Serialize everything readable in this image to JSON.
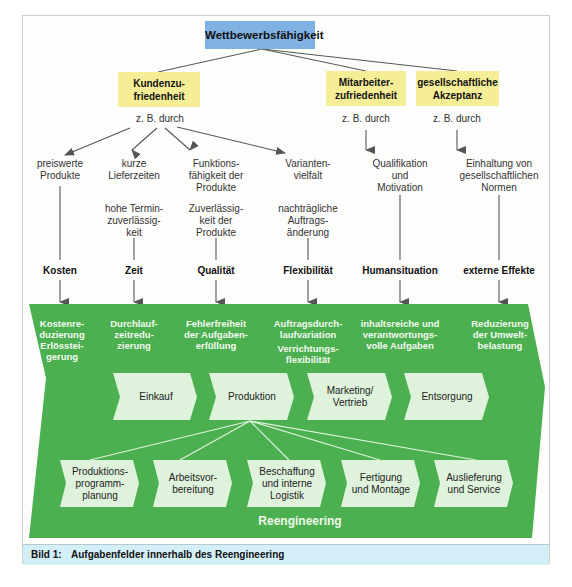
{
  "diagram": {
    "root": {
      "label": "Wettbewerbsfähigkeit",
      "color": "#7fb1e3"
    },
    "goals": [
      {
        "id": "kunden",
        "label_lines": [
          "Kundenzu-",
          "friedenheit"
        ],
        "via": "z. B. durch",
        "color": "#f5ee96"
      },
      {
        "id": "mitarbeiter",
        "label_lines": [
          "Mitarbeiter-",
          "zufriedenheit"
        ],
        "via": "z. B. durch",
        "color": "#f5ee96"
      },
      {
        "id": "gesellschaft",
        "label_lines": [
          "gesellschaftliche",
          "Akzeptanz"
        ],
        "via": "z. B. durch",
        "color": "#f5ee96"
      }
    ],
    "columns": [
      {
        "means": [
          "preiswerte",
          "Produkte"
        ],
        "detail": [],
        "criterion": "Kosten",
        "effect": [
          "Kostenre-",
          "duzierung",
          "Erlösstei-",
          "gerung"
        ]
      },
      {
        "means": [
          "kurze",
          "Lieferzeiten"
        ],
        "detail": [
          "hohe Termin-",
          "zuverlässig-",
          "keit"
        ],
        "criterion": "Zeit",
        "effect": [
          "Durchlauf-",
          "zeitredu-",
          "zierung"
        ]
      },
      {
        "means": [
          "Funktions-",
          "fähigkeit der",
          "Produkte"
        ],
        "detail": [
          "Zuverlässig-",
          "keit der",
          "Produkte"
        ],
        "criterion": "Qualität",
        "effect": [
          "Fehlerfreiheit",
          "der Aufgaben-",
          "erfüllung"
        ]
      },
      {
        "means": [
          "Varianten-",
          "vielfalt"
        ],
        "detail": [
          "nachträgliche",
          "Auftrags-",
          "änderung"
        ],
        "criterion": "Flexibilität",
        "effect": [
          "Auftragsdurch-",
          "laufvariation",
          "Verrichtungs-",
          "flexibilität"
        ]
      },
      {
        "means": [
          "Qualifikation",
          "und",
          "Motivation"
        ],
        "detail": [],
        "criterion": "Humansituation",
        "effect": [
          "inhaltsreiche und",
          "verantwortungs-",
          "volle Aufgaben"
        ]
      },
      {
        "means": [
          "Einhaltung von",
          "gesellschaftlichen",
          "Normen"
        ],
        "detail": [],
        "criterion": "externe Effekte",
        "effect": [
          "Reduzierung",
          "der Umwelt-",
          "belastung"
        ]
      }
    ],
    "process_chain": [
      "Einkauf",
      "Produktion",
      "Marketing/\nVertrieb",
      "Entsorgung"
    ],
    "production_subprocesses": [
      "Produktions-\nprogramm-\nplanung",
      "Arbeitsvor-\nbereitung",
      "Beschaffung\nund interne\nLogistik",
      "Fertigung\nund Montage",
      "Auslieferung\nund Service"
    ],
    "container_label": "Reengineering",
    "colors": {
      "green": "#4caf50",
      "process_box": "#dff3dc",
      "caption_bg": "#d3eff7"
    }
  },
  "caption": {
    "number": "Bild 1:",
    "text": "Aufgabenfelder innerhalb des Reengineering"
  }
}
